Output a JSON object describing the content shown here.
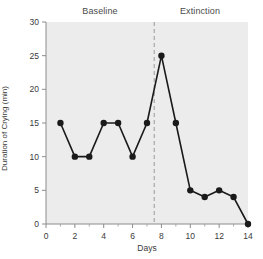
{
  "chart_data": {
    "type": "line",
    "title": "",
    "xlabel": "Days",
    "ylabel": "Duration of Crying (min)",
    "x": [
      1,
      2,
      3,
      4,
      5,
      6,
      7,
      8,
      9,
      10,
      11,
      12,
      13,
      14
    ],
    "values": [
      15,
      10,
      10,
      15,
      15,
      10,
      15,
      25,
      15,
      5,
      4,
      5,
      4,
      0
    ],
    "series": [
      {
        "name": "Duration of Crying",
        "values": [
          15,
          10,
          10,
          15,
          15,
          10,
          15,
          25,
          15,
          5,
          4,
          5,
          4,
          0
        ]
      }
    ],
    "xlim": [
      0,
      14
    ],
    "ylim": [
      0,
      30
    ],
    "x_ticks": [
      0,
      2,
      4,
      6,
      8,
      10,
      12,
      14
    ],
    "x_tick_labels": [
      "0",
      "2",
      "4",
      "6",
      "8",
      "10",
      "12",
      "14"
    ],
    "x_minor_ticks": [
      1,
      3,
      5,
      7,
      9,
      11,
      13
    ],
    "y_ticks": [
      0,
      5,
      10,
      15,
      20,
      25,
      30
    ],
    "y_tick_labels": [
      "0",
      "5",
      "10",
      "15",
      "20",
      "25",
      "30"
    ],
    "grid": false,
    "legend": "none",
    "marker": "filled-circle",
    "line_color": "#1a1a1a",
    "marker_color": "#1a1a1a",
    "plot_background": "#ececec",
    "annotations": [
      {
        "name": "phase-divider",
        "type": "vertical-dashed-line",
        "x": 7.5,
        "color": "#9a9a9a"
      }
    ],
    "phases": [
      {
        "label": "Baseline",
        "x_center": 3.75
      },
      {
        "label": "Extinction",
        "x_center": 11.0
      }
    ]
  },
  "labels": {
    "phase_baseline": "Baseline",
    "phase_extinction": "Extinction",
    "x_axis_title": "Days",
    "y_axis_title": "Duration of Crying (min)"
  }
}
